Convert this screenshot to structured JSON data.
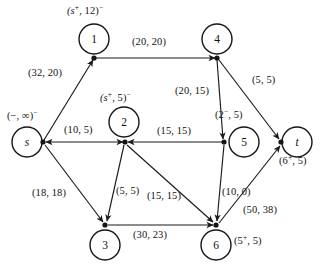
{
  "diagram": {
    "nodes": [
      {
        "id": "s",
        "label": "s",
        "flow_label": "(−, ∞)",
        "flow_sup": "−"
      },
      {
        "id": "1",
        "label": "1",
        "flow_label": "(s·, 12)",
        "flow_sup": "−",
        "inner_sup": "+"
      },
      {
        "id": "2",
        "label": "2",
        "flow_label": "(s·, 5)",
        "flow_sup": "−",
        "inner_sup": "+"
      },
      {
        "id": "3",
        "label": "3",
        "flow_label": "",
        "flow_sup": ""
      },
      {
        "id": "4",
        "label": "4",
        "flow_label": "",
        "flow_sup": ""
      },
      {
        "id": "5",
        "label": "5",
        "flow_label": "",
        "flow_sup": ""
      },
      {
        "id": "6",
        "label": "6",
        "flow_label": "(5·, 5)",
        "flow_sup": "",
        "inner_sup": "+"
      },
      {
        "id": "t",
        "label": "t",
        "flow_label": "(6·, 5)",
        "flow_sup": "",
        "inner_sup": "+"
      }
    ],
    "edges": [
      {
        "from": "s",
        "to": "1",
        "label": "(32, 20)",
        "capacity": 32,
        "flow": 20
      },
      {
        "from": "1",
        "to": "4",
        "label": "(20, 20)",
        "capacity": 20,
        "flow": 20
      },
      {
        "from": "s",
        "to": "2",
        "label": "(10, 5)",
        "capacity": 10,
        "flow": 5
      },
      {
        "from": "4",
        "to": "5",
        "label": "(20, 15)",
        "capacity": 20,
        "flow": 15
      },
      {
        "from": "4",
        "to": "t",
        "label": "(5, 5)",
        "capacity": 5,
        "flow": 5
      },
      {
        "from": "5",
        "to": "2",
        "label": "(15, 15)",
        "capacity": 15,
        "flow": 15
      },
      {
        "from": "s",
        "to": "3",
        "label": "(18, 18)",
        "capacity": 18,
        "flow": 18
      },
      {
        "from": "2",
        "to": "3",
        "label": "(5, 5)",
        "capacity": 5,
        "flow": 5
      },
      {
        "from": "2",
        "to": "6",
        "label": "(15, 15)",
        "capacity": 15,
        "flow": 15
      },
      {
        "from": "5",
        "to": "6",
        "label": "(10, 0)",
        "capacity": 10,
        "flow": 0
      },
      {
        "from": "3",
        "to": "6",
        "label": "(30, 23)",
        "capacity": 30,
        "flow": 23
      },
      {
        "from": "6",
        "to": "t",
        "label": "(50, 38)",
        "capacity": 50,
        "flow": 38
      }
    ],
    "node_flow_labels": {
      "s": "(−, ∞)",
      "n1": "(s",
      "n1_rest": ", 12)",
      "n2": "(s",
      "n2_rest": ", 5)",
      "n5_edge": "(2",
      "n5_edge_rest": ", 5)",
      "n6": "(5",
      "n6_rest": ", 5)",
      "t": "(6",
      "t_rest": ", 5)"
    },
    "edge_labels": {
      "s_1": "(32, 20)",
      "one_4": "(20, 20)",
      "s_2": "(10, 5)",
      "four_5": "(20, 15)",
      "four_t": "(5, 5)",
      "five_2": "(15, 15)",
      "s_3": "(18, 18)",
      "two_3": "(5, 5)",
      "two_6": "(15, 15)",
      "five_6": "(10, 0)",
      "three_6": "(30, 23)",
      "six_t": "(50, 38)"
    },
    "colors": {
      "stroke": "#1a1a1a",
      "background": "#ffffff",
      "text": "#121212"
    }
  }
}
